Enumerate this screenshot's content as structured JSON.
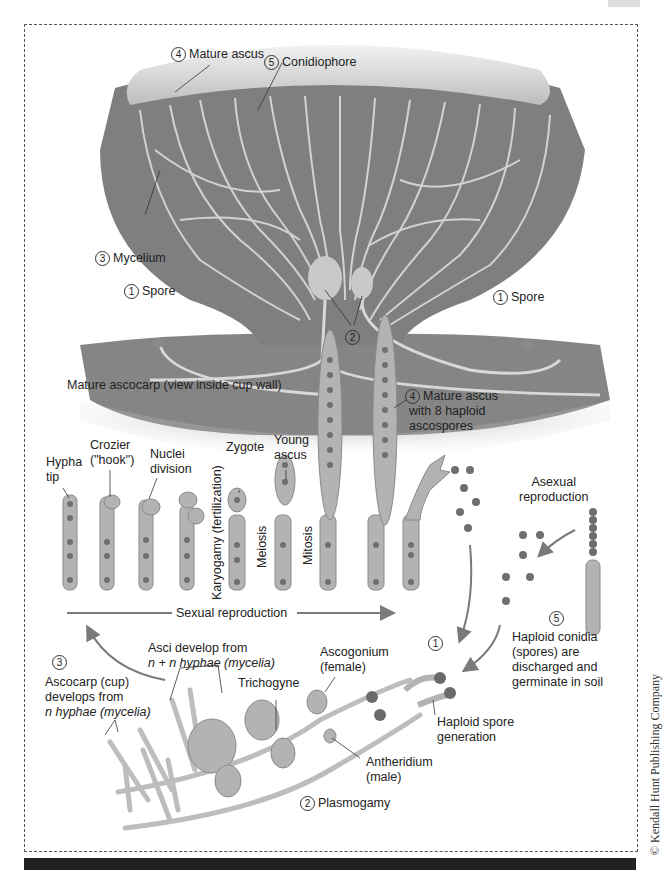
{
  "copyright": "© Kendall Hunt Publishing Company",
  "top_panel": {
    "caption": "Mature ascocarp (view inside cup wall)",
    "labels": [
      {
        "num": "4",
        "text": "Mature ascus"
      },
      {
        "num": "5",
        "text": "Conidiophore"
      },
      {
        "num": "3",
        "text": "Mycelium"
      },
      {
        "num": "1",
        "text": "Spore"
      },
      {
        "num": "1",
        "text": "Spore"
      },
      {
        "num": "2",
        "text": ""
      }
    ]
  },
  "sexual_sequence": {
    "stages": [
      {
        "label": "Hypha tip",
        "line1": "Hypha",
        "line2": "tip"
      },
      {
        "label": "Crozier (\"hook\")",
        "line1": "Crozier",
        "line2": "(\"hook\")"
      },
      {
        "label": "Nuclei division",
        "line1": "Nuclei",
        "line2": "division"
      },
      {
        "label": "Zygote",
        "line1": "Zygote",
        "line2": ""
      },
      {
        "label": "Young ascus",
        "line1": "Young",
        "line2": "ascus"
      }
    ],
    "vertical_labels": [
      "Karyogamy (fertilization)",
      "Meiosis",
      "Mitosis"
    ],
    "mature_ascus": {
      "num": "4",
      "line1": "Mature ascus",
      "line2": "with 8 haploid",
      "line3": "ascospores"
    },
    "arrow_label": "Sexual reproduction"
  },
  "asexual": {
    "title_line1": "Asexual",
    "title_line2": "reproduction",
    "conidia": {
      "num": "5",
      "lines": [
        "Haploid conidia",
        "(spores) are",
        "discharged and",
        "germinate in soil"
      ]
    }
  },
  "germination": {
    "num": "1",
    "lines": [
      "Haploid spore",
      "generation"
    ]
  },
  "bottom_panel": {
    "ascocarp": {
      "num": "3",
      "lines": [
        "Ascocarp (cup)",
        "develops from",
        "n hyphae (mycelia)"
      ]
    },
    "asci": {
      "lines": [
        "Asci develop from",
        "n + n hyphae (mycelia)"
      ]
    },
    "ascogonium": {
      "lines": [
        "Ascogonium",
        "(female)"
      ]
    },
    "trichogyne": "Trichogyne",
    "antheridium": {
      "lines": [
        "Antheridium",
        "(male)"
      ]
    },
    "plasmogamy": {
      "num": "2",
      "text": "Plasmogamy"
    }
  },
  "colors": {
    "cup_fill": "#7d7d7d",
    "cup_rim": "#e6e6e6",
    "hyphae": "#d8d8d8",
    "cell_fill": "#b3b3b3",
    "cell_stroke": "#8a8a8a",
    "nucleus": "#6f6f6f",
    "arrow": "#7a7a7a"
  }
}
